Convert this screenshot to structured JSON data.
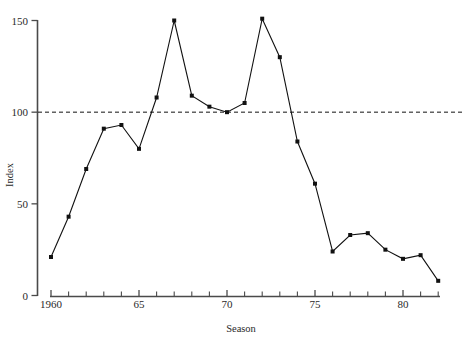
{
  "chart_data": {
    "type": "line",
    "title": "",
    "subtitle": "",
    "xlabel": "Season",
    "ylabel": "Index",
    "xlim": [
      1959.5,
      1982.5
    ],
    "ylim": [
      0,
      150
    ],
    "grid": false,
    "legend": null,
    "y_ticks": [
      0,
      50,
      100,
      150
    ],
    "y_tick_labels": [
      "0",
      "50",
      "100",
      "150"
    ],
    "x_ticks": [
      1960,
      1961,
      1962,
      1963,
      1964,
      1965,
      1966,
      1967,
      1968,
      1969,
      1970,
      1971,
      1972,
      1973,
      1974,
      1975,
      1976,
      1977,
      1978,
      1979,
      1980,
      1981,
      1982
    ],
    "x_tick_labels": [
      {
        "value": 1960,
        "label": "1960"
      },
      {
        "value": 1965,
        "label": "65"
      },
      {
        "value": 1970,
        "label": "70"
      },
      {
        "value": 1975,
        "label": "75"
      },
      {
        "value": 1980,
        "label": "80"
      }
    ],
    "reference_line": {
      "value": 100,
      "style": "dashed",
      "color": "#111111"
    },
    "x": [
      1960,
      1961,
      1962,
      1963,
      1964,
      1965,
      1966,
      1967,
      1968,
      1969,
      1970,
      1971,
      1972,
      1973,
      1974,
      1975,
      1976,
      1977,
      1978,
      1979,
      1980,
      1981,
      1982
    ],
    "values": [
      21,
      43,
      69,
      91,
      93,
      80,
      108,
      150,
      109,
      103,
      100,
      105,
      151,
      130,
      84,
      61,
      24,
      33,
      34,
      25,
      20,
      22,
      8
    ],
    "series": [
      {
        "name": "Index",
        "marker": "filled-square",
        "color": "#111111",
        "values": [
          21,
          43,
          69,
          91,
          93,
          80,
          108,
          150,
          109,
          103,
          100,
          105,
          151,
          130,
          84,
          61,
          24,
          33,
          34,
          25,
          20,
          22,
          8
        ]
      }
    ]
  },
  "axes": {
    "x_title": "Season",
    "y_title": "Index"
  }
}
